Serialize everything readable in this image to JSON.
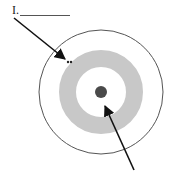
{
  "diagram": {
    "label_1": "I.",
    "answer_blank": "",
    "center": {
      "x": 101,
      "y": 92
    },
    "outer_circle": {
      "r": 62,
      "stroke": "#555555"
    },
    "shaded_ring": {
      "outer_r": 42,
      "inner_r": 25,
      "fill": "#c8c8c8"
    },
    "nucleus_dot": {
      "r": 6,
      "fill": "#4a4a4a"
    },
    "arrows": [
      {
        "name": "arrow-to-ring",
        "from": [
          14,
          18
        ],
        "to": [
          66,
          60
        ]
      },
      {
        "name": "arrow-to-nucleus",
        "from": [
          134,
          170
        ],
        "to": [
          105,
          106
        ]
      }
    ],
    "marks": "••"
  }
}
